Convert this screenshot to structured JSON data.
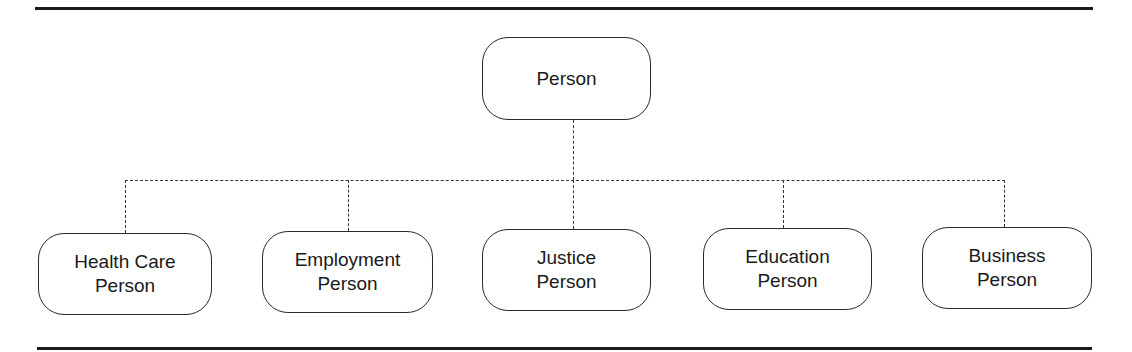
{
  "diagram": {
    "type": "hierarchy",
    "root": {
      "label_lines": [
        "Person"
      ]
    },
    "children": [
      {
        "label_lines": [
          "Health Care",
          "Person"
        ]
      },
      {
        "label_lines": [
          "Employment",
          "Person"
        ]
      },
      {
        "label_lines": [
          "Justice",
          "Person"
        ]
      },
      {
        "label_lines": [
          "Education",
          "Person"
        ]
      },
      {
        "label_lines": [
          "Business",
          "Person"
        ]
      }
    ],
    "connector_style": "dashed",
    "colors": {
      "line": "#1c1c1c",
      "node_border": "#2a2a2a",
      "background": "#ffffff"
    }
  }
}
